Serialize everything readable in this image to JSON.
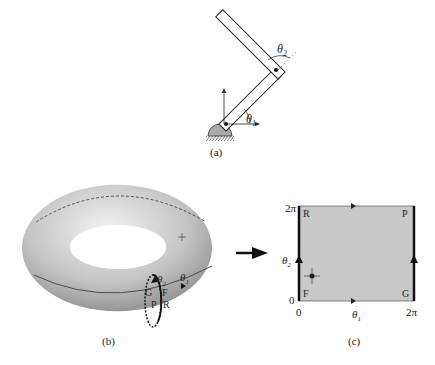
{
  "panels": {
    "a": {
      "caption": "(a)",
      "theta1": "θ",
      "theta1_sub": "1",
      "theta2": "θ",
      "theta2_sub": "2"
    },
    "b": {
      "caption": "(b)",
      "theta1": "θ",
      "theta1_sub": "1",
      "theta2": "θ",
      "theta2_sub": "2",
      "points": [
        "G",
        "F",
        "P",
        "R"
      ]
    },
    "c": {
      "caption": "(c)",
      "x_ticks": [
        "0",
        "2π"
      ],
      "y_ticks": [
        "0",
        "2π"
      ],
      "xlabel": "θ",
      "xlabel_sub": "1",
      "ylabel": "θ",
      "ylabel_sub": "2",
      "corners": {
        "top_left": "R",
        "top_right": "P",
        "bottom_left": "F",
        "bottom_right": "G"
      }
    }
  },
  "colors": {
    "square_fill": "#c8c8c8",
    "ink": "#111111",
    "torus_light": "#e8e8e8",
    "torus_dark": "#8a8a8a"
  }
}
